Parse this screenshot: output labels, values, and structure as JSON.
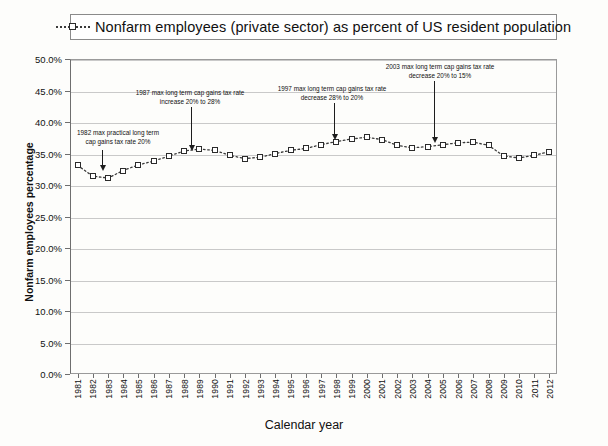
{
  "legend": {
    "marker_icon": "open-square-dotted-line-icon",
    "label": "Nonfarm employees (private sector) as percent of US resident population"
  },
  "axes": {
    "y_title": "Nonfarm employees percentage",
    "x_title": "Calendar year",
    "y_ticks": [
      "0.0%",
      "5.0%",
      "10.0%",
      "15.0%",
      "20.0%",
      "25.0%",
      "30.0%",
      "35.0%",
      "40.0%",
      "45.0%",
      "50.0%"
    ]
  },
  "annotations": [
    {
      "id": "anno-1982",
      "line1": "1982 max practical long term",
      "line2": "cap gains tax rate 20%",
      "target_year": "1982"
    },
    {
      "id": "anno-1987",
      "line1": "1987 max long term cap gains tax rate",
      "line2": "increase 20% to  28%",
      "target_year": "1987"
    },
    {
      "id": "anno-1997",
      "line1": "1997 max long term cap gains tax rate",
      "line2": "decrease 28% to 20%",
      "target_year": "1997"
    },
    {
      "id": "anno-2003",
      "line1": "2003 max long term cap gains tax rate",
      "line2": "decrease 20% to 15%",
      "target_year": "2003"
    }
  ],
  "colors": {
    "line": "#3a3a3a",
    "marker_fill": "#ffffff",
    "marker_stroke": "#2b2b2b",
    "grid": "#c9c9c9",
    "axis": "#6e6e6e",
    "text": "#111111",
    "background": "#fdfdfb"
  },
  "chart_data": {
    "type": "line",
    "title": "Nonfarm employees (private sector) as percent of US resident population",
    "xlabel": "Calendar year",
    "ylabel": "Nonfarm employees percentage",
    "ylim": [
      0,
      50
    ],
    "ytick_step": 5,
    "grid": true,
    "legend_position": "top",
    "marker": "open-square",
    "linestyle": "dotted",
    "categories": [
      "1981",
      "1982",
      "1983",
      "1984",
      "1985",
      "1986",
      "1987",
      "1988",
      "1989",
      "1990",
      "1991",
      "1992",
      "1993",
      "1994",
      "1995",
      "1996",
      "1997",
      "1998",
      "1999",
      "2000",
      "2001",
      "2002",
      "2003",
      "2004",
      "2005",
      "2006",
      "2007",
      "2008",
      "2009",
      "2010",
      "2011",
      "2012"
    ],
    "series": [
      {
        "name": "Nonfarm employees (private sector) as percent of US resident population",
        "values": [
          33.1,
          31.4,
          31.1,
          32.3,
          33.2,
          33.8,
          34.6,
          35.4,
          35.7,
          35.5,
          34.7,
          34.2,
          34.4,
          35.0,
          35.5,
          35.8,
          36.4,
          36.9,
          37.3,
          37.6,
          37.2,
          36.3,
          35.9,
          36.1,
          36.4,
          36.7,
          36.8,
          36.3,
          34.6,
          34.3,
          34.7,
          35.3
        ]
      }
    ]
  }
}
